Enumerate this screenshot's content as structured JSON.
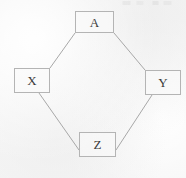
{
  "figure": {
    "type": "lattice-diagram",
    "background_color": "#f5f5f5",
    "node_border_color": "#b4b4b4",
    "node_fill_color": "#fafafa",
    "edge_color": "#a8a8a8",
    "label_color": "#3a3a3a"
  },
  "nodes": [
    {
      "id": "A",
      "label": "A",
      "x": 75,
      "y": 11,
      "w": 39,
      "h": 22
    },
    {
      "id": "X",
      "label": "X",
      "x": 14,
      "y": 68,
      "w": 36,
      "h": 25
    },
    {
      "id": "Y",
      "label": "Y",
      "x": 145,
      "y": 70,
      "w": 36,
      "h": 25
    },
    {
      "id": "Z",
      "label": "Z",
      "x": 79,
      "y": 132,
      "w": 37,
      "h": 25
    }
  ],
  "edges": [
    {
      "id": "A-X",
      "from": "A",
      "to": "X",
      "x1": 75,
      "y1": 33,
      "x2": 50,
      "y2": 68
    },
    {
      "id": "A-Y",
      "from": "A",
      "to": "Y",
      "x1": 114,
      "y1": 33,
      "x2": 145,
      "y2": 70
    },
    {
      "id": "X-Z",
      "from": "X",
      "to": "Z",
      "x1": 39,
      "y1": 93,
      "x2": 79,
      "y2": 150
    },
    {
      "id": "Y-Z",
      "from": "Y",
      "to": "Z",
      "x1": 152,
      "y1": 95,
      "x2": 116,
      "y2": 150
    }
  ]
}
